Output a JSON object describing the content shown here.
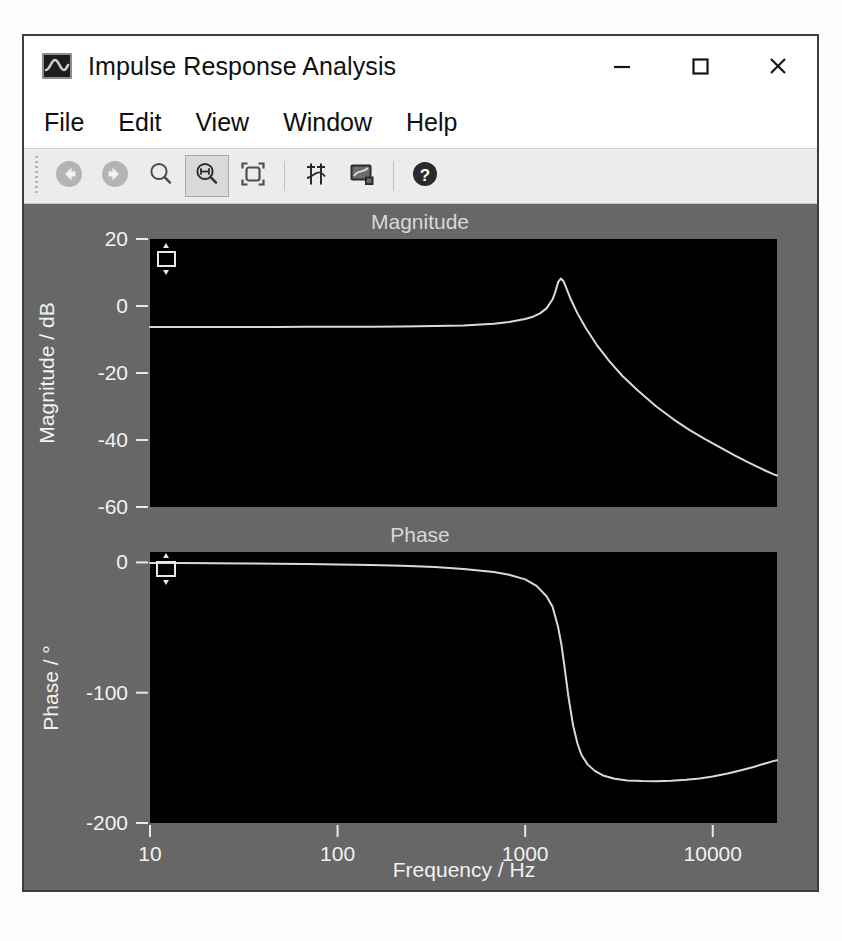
{
  "window": {
    "title": "Impulse Response Analysis",
    "icon": "waveform-icon",
    "controls": {
      "minimize": "–",
      "maximize": "□",
      "close": "✕"
    }
  },
  "menu": {
    "items": [
      {
        "label": "File"
      },
      {
        "label": "Edit"
      },
      {
        "label": "View"
      },
      {
        "label": "Window"
      },
      {
        "label": "Help"
      }
    ]
  },
  "toolbar": {
    "buttons": [
      {
        "name": "back-icon",
        "tooltip": "Back",
        "pressed": false
      },
      {
        "name": "forward-icon",
        "tooltip": "Forward",
        "pressed": false
      },
      {
        "name": "zoom-icon",
        "tooltip": "Zoom",
        "pressed": false
      },
      {
        "name": "zoom-x-icon",
        "tooltip": "Zoom Horizontal",
        "pressed": true
      },
      {
        "name": "fit-window-icon",
        "tooltip": "Fit to Window",
        "pressed": false
      },
      {
        "name": "markers-icon",
        "tooltip": "Markers",
        "pressed": false
      },
      {
        "name": "annotation-icon",
        "tooltip": "Annotation",
        "pressed": false
      },
      {
        "name": "help-icon",
        "tooltip": "Help",
        "pressed": false
      }
    ]
  },
  "colors": {
    "plot_background": "#676767",
    "axes_background": "#000000",
    "trace": "#d9d9d9",
    "tick_text": "#f2f2f2",
    "window_border": "#3e3e3e",
    "toolbar_background": "#ececec"
  },
  "chart_data": [
    {
      "type": "line",
      "id": "magnitude",
      "title": "Magnitude",
      "xlabel": "",
      "ylabel": "Magnitude / dB",
      "xscale": "log",
      "xlim": [
        10,
        22000
      ],
      "ylim": [
        -60,
        20
      ],
      "xticks": [
        10,
        100,
        1000,
        10000
      ],
      "xticklabels": [
        "10",
        "100",
        "1000",
        "10000"
      ],
      "yticks": [
        20,
        0,
        -20,
        -40,
        -60
      ],
      "yticklabels": [
        "20",
        "0",
        "-20",
        "-40",
        "-60"
      ],
      "grid": false,
      "legend": null,
      "series": [
        {
          "name": "magnitude-trace",
          "x": [
            10,
            15,
            22,
            33,
            47,
            68,
            100,
            150,
            220,
            330,
            470,
            680,
            820,
            1000,
            1100,
            1200,
            1300,
            1400,
            1450,
            1500,
            1550,
            1600,
            1650,
            1750,
            1900,
            2100,
            2400,
            2800,
            3300,
            4000,
            5000,
            6200,
            7500,
            9000,
            11000,
            13000,
            15000,
            17000,
            19000,
            21000,
            22000
          ],
          "y": [
            -6.3,
            -6.3,
            -6.3,
            -6.3,
            -6.3,
            -6.2,
            -6.2,
            -6.2,
            -6.1,
            -6.0,
            -5.8,
            -5.3,
            -4.8,
            -3.9,
            -3.2,
            -2.2,
            -0.7,
            2.0,
            4.3,
            7.2,
            8.2,
            7.4,
            5.6,
            2.0,
            -2.2,
            -6.5,
            -11.5,
            -16.4,
            -20.9,
            -25.3,
            -30.0,
            -33.9,
            -37.0,
            -39.6,
            -42.3,
            -44.5,
            -46.3,
            -47.8,
            -49.1,
            -50.2,
            -50.6
          ]
        }
      ],
      "annotations": [
        {
          "name": "y-range-handle",
          "type": "drag-handle",
          "x": 10,
          "y": 14
        }
      ]
    },
    {
      "type": "line",
      "id": "phase",
      "title": "Phase",
      "xlabel": "Frequency / Hz",
      "ylabel": "Phase / °",
      "xscale": "log",
      "xlim": [
        10,
        22000
      ],
      "ylim": [
        -200,
        8
      ],
      "xticks": [
        10,
        100,
        1000,
        10000
      ],
      "xticklabels": [
        "10",
        "100",
        "1000",
        "10000"
      ],
      "yticks": [
        0,
        -100,
        -200
      ],
      "yticklabels": [
        "0",
        "-100",
        "-200"
      ],
      "grid": false,
      "legend": null,
      "series": [
        {
          "name": "phase-trace",
          "x": [
            10,
            15,
            22,
            33,
            47,
            68,
            100,
            150,
            220,
            330,
            470,
            680,
            820,
            1000,
            1150,
            1300,
            1400,
            1500,
            1560,
            1620,
            1700,
            1800,
            1900,
            2000,
            2150,
            2350,
            2600,
            3000,
            3500,
            4200,
            5000,
            6000,
            7200,
            8500,
            10000,
            12000,
            14000,
            16500,
            19000,
            21000,
            22000
          ],
          "y": [
            -0.4,
            -0.5,
            -0.6,
            -0.8,
            -1.0,
            -1.2,
            -1.5,
            -2.0,
            -2.6,
            -3.6,
            -5.0,
            -7.4,
            -9.5,
            -13.0,
            -18.0,
            -26.0,
            -34.0,
            -50.0,
            -63.0,
            -80.0,
            -103.0,
            -125.0,
            -139.0,
            -148.0,
            -155.0,
            -160.0,
            -163.5,
            -166.0,
            -167.3,
            -167.8,
            -167.9,
            -167.5,
            -166.8,
            -165.8,
            -164.3,
            -162.0,
            -159.7,
            -157.0,
            -154.3,
            -152.5,
            -151.8
          ]
        }
      ],
      "annotations": [
        {
          "name": "y-range-handle",
          "type": "drag-handle",
          "x": 10,
          "y": 0
        }
      ]
    }
  ]
}
